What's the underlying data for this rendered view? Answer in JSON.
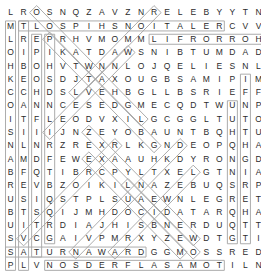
{
  "puzzle": {
    "type": "word-search",
    "columns": 20,
    "rows": 18,
    "cell_width": 13.05,
    "cell_height": 13.3,
    "grid_origin_x": 4,
    "grid_origin_y": 6,
    "letter_color": "#2b2b2b",
    "highlight_color": "#a8a8a8",
    "background_color": "#ffffff",
    "rows_text": [
      "LROSNQZAVZNRELEBYYTN",
      "MTLOSPIHSNOITALERCVV",
      "LREPRHVMOMMLIFRORROH",
      "OIPIKATDAWSNIBTUMDAD",
      "HBOHVTWNNLOJQELIESNL",
      "KEOSDJTAXOUGBSAMIPIM",
      "CCHDSLVEHBGLLBSRIEFF",
      "OANNCESEDGMECQDTWUNP",
      "ITFLEODVXILGCGGLTUTOM",
      "SIIIJNZEYOBAUNTBQHTU",
      "NLNRZREXRLKGNDEOPQHA",
      "AMDFEWEXAAUHKDYRONGD",
      "BFQTIBRCPYLTXELGTNIA",
      "REVBZOIKILNAZEBUQSRP",
      "USIQSTPLSUAEWNLEGRET",
      "BTSQIJMHDOCIDATARQHA",
      "UITRDIAJHISBNERDUQTT",
      "SVCGAIVPMRXYZEWDTGTI",
      "SATURNAWARDGGMOSSRED",
      "PLVNOSDERFLASAMOTILN"
    ],
    "highlight_paths": [
      {
        "name": "relationships",
        "start_row": 1,
        "start_col": 1,
        "end_row": 1,
        "end_col": 16,
        "direction": "horizontal"
      },
      {
        "name": "horror-film",
        "start_row": 2,
        "start_col": 11,
        "end_row": 2,
        "end_col": 19,
        "direction": "horizontal"
      },
      {
        "name": "saturn-award",
        "start_row": 18,
        "start_col": 0,
        "end_row": 18,
        "end_col": 10,
        "direction": "horizontal"
      },
      {
        "name": "tomas-alfredson",
        "start_row": 19,
        "start_col": 3,
        "end_row": 19,
        "end_col": 16,
        "direction": "horizontal"
      },
      {
        "name": "vertical-left-a",
        "start_row": 1,
        "start_col": 0,
        "end_row": 19,
        "end_col": 0,
        "direction": "vertical"
      },
      {
        "name": "vertical-left-b",
        "start_row": 1,
        "start_col": 1,
        "end_row": 19,
        "end_col": 1,
        "direction": "vertical"
      },
      {
        "name": "vertical-left-c",
        "start_row": 2,
        "start_col": 2,
        "end_row": 18,
        "end_col": 2,
        "direction": "vertical"
      },
      {
        "name": "vertical-left-d",
        "start_row": 2,
        "start_col": 3,
        "end_row": 17,
        "end_col": 3,
        "direction": "vertical"
      },
      {
        "name": "vertical-right-a",
        "start_row": 5,
        "start_col": 18,
        "end_row": 17,
        "end_col": 18,
        "direction": "vertical"
      },
      {
        "name": "vertical-right-b",
        "start_row": 7,
        "start_col": 17,
        "end_row": 17,
        "end_col": 17,
        "direction": "vertical"
      },
      {
        "name": "diagonal-1",
        "start_row": 0,
        "start_col": 2,
        "end_row": 8,
        "end_col": 10,
        "direction": "diagonal-down-right"
      },
      {
        "name": "diagonal-2",
        "start_row": 0,
        "start_col": 11,
        "end_row": 6,
        "end_col": 5,
        "direction": "diagonal-down-left"
      },
      {
        "name": "diagonal-3",
        "start_row": 2,
        "start_col": 3,
        "end_row": 10,
        "end_col": 11,
        "direction": "diagonal-down-right"
      },
      {
        "name": "diagonal-4",
        "start_row": 3,
        "start_col": 9,
        "end_row": 9,
        "end_col": 3,
        "direction": "diagonal-down-left"
      },
      {
        "name": "diagonal-5",
        "start_row": 9,
        "start_col": 6,
        "end_row": 17,
        "end_col": 14,
        "direction": "diagonal-down-right"
      },
      {
        "name": "diagonal-6",
        "start_row": 10,
        "start_col": 8,
        "end_row": 17,
        "end_col": 1,
        "direction": "diagonal-down-left"
      },
      {
        "name": "diagonal-7",
        "start_row": 10,
        "start_col": 13,
        "end_row": 18,
        "end_col": 5,
        "direction": "diagonal-down-left"
      },
      {
        "name": "diagonal-8",
        "start_row": 11,
        "start_col": 6,
        "end_row": 18,
        "end_col": 13,
        "direction": "diagonal-down-right"
      },
      {
        "name": "diagonal-9",
        "start_row": 12,
        "start_col": 14,
        "end_row": 18,
        "end_col": 8,
        "direction": "diagonal-down-left"
      },
      {
        "name": "diagonal-10",
        "start_row": 13,
        "start_col": 9,
        "end_row": 18,
        "end_col": 14,
        "direction": "diagonal-down-right"
      }
    ]
  }
}
